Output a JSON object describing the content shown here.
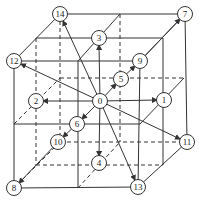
{
  "diagram": {
    "title": "",
    "type": "3D lattice velocity directions (D3Q15-style cube)",
    "nodes": [
      {
        "id": "0",
        "x": 100,
        "y": 101
      },
      {
        "id": "1",
        "x": 164,
        "y": 100
      },
      {
        "id": "2",
        "x": 36,
        "y": 101
      },
      {
        "id": "3",
        "x": 99,
        "y": 38
      },
      {
        "id": "4",
        "x": 99,
        "y": 163
      },
      {
        "id": "5",
        "x": 121,
        "y": 79
      },
      {
        "id": "6",
        "x": 77,
        "y": 124
      },
      {
        "id": "7",
        "x": 185,
        "y": 14
      },
      {
        "id": "8",
        "x": 14,
        "y": 188
      },
      {
        "id": "9",
        "x": 140,
        "y": 61
      },
      {
        "id": "10",
        "x": 58,
        "y": 142
      },
      {
        "id": "11",
        "x": 187,
        "y": 142
      },
      {
        "id": "12",
        "x": 14,
        "y": 61
      },
      {
        "id": "13",
        "x": 138,
        "y": 187
      },
      {
        "id": "14",
        "x": 60,
        "y": 14
      }
    ],
    "arrows_from_0": [
      "1",
      "2",
      "3",
      "4",
      "5",
      "6",
      "7",
      "8",
      "9",
      "10",
      "11",
      "12",
      "13",
      "14"
    ],
    "colors": {
      "line": "#333333",
      "node_fill": "#ffffff",
      "background": "#ffffff"
    }
  }
}
